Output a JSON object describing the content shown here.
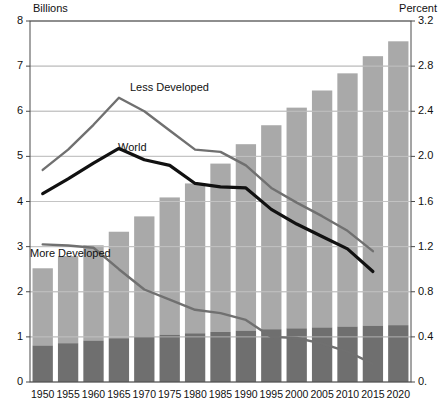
{
  "chart_data": {
    "type": "bar",
    "title": "",
    "subtitle": "",
    "ylabel": "Billions",
    "ylabel_right": "Percent",
    "xlabel": "",
    "grid": true,
    "legend_position": "inline-annotations",
    "categories": [
      "1950",
      "1955",
      "1960",
      "1965",
      "1970",
      "1975",
      "1980",
      "1985",
      "1990",
      "1995",
      "2000",
      "2005",
      "2010",
      "2015",
      "2020"
    ],
    "ylim": [
      0,
      8
    ],
    "yticks": [
      "0",
      "1",
      "2",
      "3",
      "4",
      "5",
      "6",
      "7",
      "8"
    ],
    "ylim_right": [
      0,
      3.2
    ],
    "yticks_right": [
      "0.",
      "0.4",
      "0.8",
      "1.2",
      "1.6",
      "2.0",
      "2.4",
      "2.8",
      "3.2"
    ],
    "bar_series": [
      {
        "name": "More Developed",
        "axis": "left",
        "unit": "billions",
        "color": "#6f6f6f",
        "values": [
          0.81,
          0.86,
          0.92,
          0.97,
          1.01,
          1.05,
          1.08,
          1.11,
          1.14,
          1.17,
          1.19,
          1.21,
          1.23,
          1.25,
          1.26
        ]
      },
      {
        "name": "Less Developed",
        "axis": "left",
        "unit": "billions",
        "color": "#a9a9a9",
        "values": [
          1.71,
          1.93,
          2.11,
          2.36,
          2.66,
          3.04,
          3.32,
          3.73,
          4.13,
          4.52,
          4.89,
          5.25,
          5.61,
          5.97,
          6.29
        ]
      }
    ],
    "bar_totals": [
      2.52,
      2.79,
      3.03,
      3.33,
      3.67,
      4.09,
      4.4,
      4.84,
      5.27,
      5.69,
      6.08,
      6.46,
      6.84,
      7.22,
      7.55
    ],
    "line_series": [
      {
        "name": "Less Developed",
        "axis": "right",
        "unit": "percent",
        "color": "#707070",
        "x": [
          "1950",
          "1955",
          "1960",
          "1965",
          "1970",
          "1975",
          "1980",
          "1985",
          "1990",
          "1995",
          "2000",
          "2005",
          "2010",
          "2015"
        ],
        "values": [
          1.88,
          2.06,
          2.28,
          2.52,
          2.4,
          2.23,
          2.06,
          2.04,
          1.92,
          1.72,
          1.59,
          1.47,
          1.34,
          1.16
        ]
      },
      {
        "name": "World",
        "axis": "right",
        "unit": "percent",
        "color": "#111111",
        "x": [
          "1950",
          "1955",
          "1960",
          "1965",
          "1970",
          "1975",
          "1980",
          "1985",
          "1990",
          "1995",
          "2000",
          "2005",
          "2010",
          "2015"
        ],
        "values": [
          1.67,
          1.8,
          1.94,
          2.07,
          1.97,
          1.92,
          1.76,
          1.73,
          1.72,
          1.53,
          1.4,
          1.29,
          1.18,
          0.98
        ]
      },
      {
        "name": "More Developed",
        "axis": "right",
        "unit": "percent",
        "color": "#707070",
        "x": [
          "1950",
          "1955",
          "1960",
          "1965",
          "1970",
          "1975",
          "1980",
          "1985",
          "1990",
          "1995",
          "2000",
          "2005",
          "2010",
          "2015"
        ],
        "values": [
          1.22,
          1.21,
          1.19,
          1.0,
          0.82,
          0.73,
          0.64,
          0.61,
          0.55,
          0.4,
          0.39,
          0.34,
          0.27,
          0.16
        ]
      }
    ],
    "annotations": [
      {
        "text": "Less Developed",
        "x": 130,
        "y": 81
      },
      {
        "text": "World",
        "x": 118,
        "y": 141
      },
      {
        "text": "More Developed",
        "x": 30,
        "y": 247
      }
    ]
  },
  "colors": {
    "bar_light": "#a9a9a9",
    "bar_dark": "#6f6f6f",
    "line_world": "#111111",
    "line_gray": "#707070",
    "grid": "#9a9a9a",
    "frame": "#4a4a4a",
    "text": "#1a1a1a",
    "background": "#ffffff"
  }
}
